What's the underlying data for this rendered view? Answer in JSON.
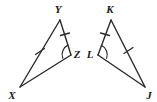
{
  "figure": {
    "background_color": "#ffffff",
    "stroke_color": "#2b2b2b",
    "label_color": "#1a1a1a",
    "triangles": [
      {
        "name": "triangle-xyz",
        "vertices": [
          {
            "label": "Y",
            "x": 60,
            "y": 20,
            "label_x": 58,
            "label_y": 13
          },
          {
            "label": "Z",
            "x": 71,
            "y": 55,
            "label_x": 76,
            "label_y": 57
          },
          {
            "label": "X",
            "x": 20,
            "y": 87,
            "label_x": 11,
            "label_y": 98
          }
        ],
        "sides": [
          {
            "name": "side-XY",
            "from": "X",
            "to": "Y",
            "ticks": 1
          },
          {
            "name": "side-YZ",
            "from": "Y",
            "to": "Z",
            "ticks": 1
          },
          {
            "name": "side-XZ",
            "from": "X",
            "to": "Z",
            "ticks": 0
          }
        ],
        "angle_arcs": [
          {
            "name": "angle-arc-Z",
            "at": "Z"
          }
        ]
      },
      {
        "name": "triangle-klj",
        "vertices": [
          {
            "label": "K",
            "x": 111,
            "y": 20,
            "label_x": 109,
            "label_y": 13
          },
          {
            "label": "L",
            "x": 98,
            "y": 55,
            "label_x": 88,
            "label_y": 57
          },
          {
            "label": "J",
            "x": 145,
            "y": 87,
            "label_x": 147,
            "label_y": 98
          }
        ],
        "sides": [
          {
            "name": "side-KL",
            "from": "K",
            "to": "L",
            "ticks": 1
          },
          {
            "name": "side-KJ",
            "from": "K",
            "to": "J",
            "ticks": 1
          },
          {
            "name": "side-LJ",
            "from": "L",
            "to": "J",
            "ticks": 0
          }
        ],
        "angle_arcs": [
          {
            "name": "angle-arc-L",
            "at": "L"
          }
        ]
      }
    ],
    "labels": {
      "y": "Y",
      "z": "Z",
      "x": "X",
      "k": "K",
      "l": "L",
      "j": "J"
    }
  }
}
